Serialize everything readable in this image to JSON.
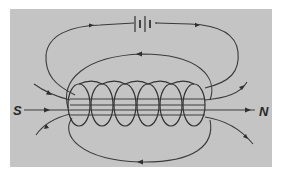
{
  "figure": {
    "background_color": "#c4c4c4",
    "line_color": "#333333",
    "labels": {
      "south": "S",
      "north": "N"
    },
    "components": {
      "battery": "battery-symbol",
      "coil_turns": 6
    }
  }
}
